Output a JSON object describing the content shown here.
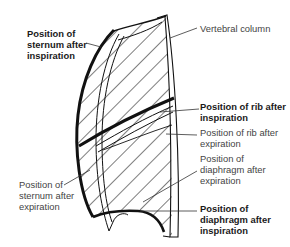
{
  "diagram": {
    "labels": {
      "sternum_inspiration": {
        "lines": [
          "Position of",
          "sternum after",
          "inspiration"
        ],
        "weight": "bold"
      },
      "vertebral_column": {
        "lines": [
          "Vertebral column"
        ],
        "weight": "normal"
      },
      "rib_inspiration": {
        "lines": [
          "Position of rib after",
          "inspiration"
        ],
        "weight": "bold"
      },
      "rib_expiration": {
        "lines": [
          "Position of rib after",
          "expiration"
        ],
        "weight": "normal"
      },
      "diaphragm_expiration": {
        "lines": [
          "Position of",
          "diaphragm after",
          "expiration"
        ],
        "weight": "normal"
      },
      "sternum_expiration": {
        "lines": [
          "Position of",
          "sternum after",
          "expiration"
        ],
        "weight": "normal"
      },
      "diaphragm_inspiration": {
        "lines": [
          "Position of",
          "diaphragm after",
          "inspiration"
        ],
        "weight": "bold"
      }
    },
    "colors": {
      "line": "#111111",
      "text": "#1a1a1a",
      "background": "#ffffff"
    }
  }
}
